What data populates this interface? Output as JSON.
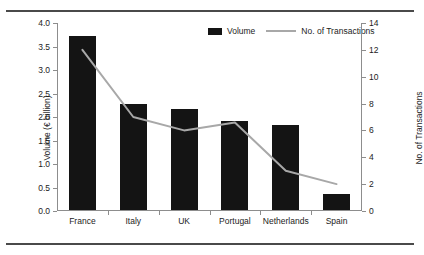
{
  "chart_data": {
    "type": "bar",
    "title": "",
    "subtitle": "",
    "categories": [
      "France",
      "Italy",
      "UK",
      "Portugal",
      "Netherlands",
      "Spain"
    ],
    "series": [
      {
        "name": "Volume",
        "type": "bar",
        "axis": "left",
        "color": "#141414",
        "values": [
          3.7,
          2.25,
          2.15,
          1.9,
          1.8,
          0.35
        ]
      },
      {
        "name": "No. of Transactions",
        "type": "line",
        "axis": "right",
        "color": "#a8a8a8",
        "values": [
          12,
          7,
          6,
          6.6,
          3,
          2
        ]
      }
    ],
    "xlabel": "",
    "ylabel": "Volume (€ billion)",
    "y2label": "No. of Transactions",
    "ylim": [
      0,
      4.0
    ],
    "y2lim": [
      0,
      14
    ],
    "yticks": [
      "0.0",
      "0.5",
      "1.0",
      "1.5",
      "2.0",
      "2.5",
      "3.0",
      "3.5",
      "4.0"
    ],
    "ytick_values": [
      0,
      0.5,
      1.0,
      1.5,
      2.0,
      2.5,
      3.0,
      3.5,
      4.0
    ],
    "y2ticks": [
      "0",
      "2",
      "4",
      "6",
      "8",
      "10",
      "12",
      "14"
    ],
    "y2tick_values": [
      0,
      2,
      4,
      6,
      8,
      10,
      12,
      14
    ],
    "grid": false,
    "legend_position": "top-right",
    "legend": [
      "Volume",
      "No. of Transactions"
    ]
  },
  "legend": {
    "volume_label": "Volume",
    "transactions_label": "No. of Transactions"
  },
  "axes": {
    "left_title": "Volume (€ billion)",
    "right_title": "No. of Transactions"
  },
  "colors": {
    "bar": "#141414",
    "line": "#a8a8a8",
    "axis": "#8d8d8d",
    "rule": "#4a4a4a",
    "text": "#1c1c1c",
    "background": "#ffffff"
  }
}
